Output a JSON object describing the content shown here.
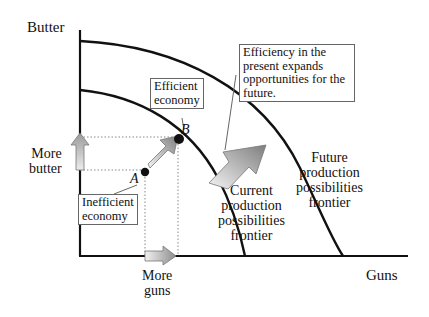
{
  "diagram": {
    "type": "production-possibilities-frontier",
    "axes": {
      "y_label": "Butter",
      "x_label": "Guns"
    },
    "curves": [
      {
        "id": "current",
        "label_lines": [
          "Current",
          "production",
          "possibilities",
          "frontier"
        ]
      },
      {
        "id": "future",
        "label_lines": [
          "Future",
          "production",
          "possibilities",
          "frontier"
        ]
      }
    ],
    "points": [
      {
        "id": "A",
        "label": "A",
        "callout_lines": [
          "Inefficient",
          "economy"
        ]
      },
      {
        "id": "B",
        "label": "B",
        "callout_lines": [
          "Efficient",
          "economy"
        ]
      }
    ],
    "arrow_labels": {
      "more_butter": [
        "More",
        "butter"
      ],
      "more_guns": [
        "More",
        "guns"
      ]
    },
    "annotation_lines": [
      "Efficiency in the",
      "present expands",
      "opportunities for the",
      "future."
    ],
    "colors": {
      "line": "#111111",
      "arrow_light": "#f2f2f2",
      "arrow_dark": "#8a8a8a",
      "box_border": "#666666"
    }
  }
}
